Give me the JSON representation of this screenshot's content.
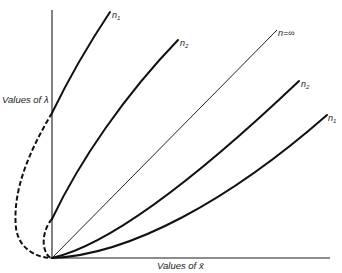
{
  "diagram": {
    "y_axis_label": "Values of λ",
    "x_axis_label": "Values of x̄",
    "curves": [
      {
        "id": "upper-n1",
        "label": "n",
        "subscript": "1",
        "style": "solid-thick",
        "dashed_continuation": true
      },
      {
        "id": "upper-n2",
        "label": "n",
        "subscript": "2",
        "style": "solid-thick",
        "dashed_continuation": true
      },
      {
        "id": "n-infinity",
        "label": "n=∞",
        "style": "solid-thin"
      },
      {
        "id": "lower-n2",
        "label": "n",
        "subscript": "2",
        "style": "solid-thick"
      },
      {
        "id": "lower-n1",
        "label": "n",
        "subscript": "1",
        "style": "solid-thick"
      }
    ],
    "labels": {
      "upper_n1": "n",
      "upper_n1_sub": "1",
      "upper_n2": "n",
      "upper_n2_sub": "2",
      "n_inf": "n=∞",
      "lower_n2": "n",
      "lower_n2_sub": "2",
      "lower_n1": "n",
      "lower_n1_sub": "1"
    }
  }
}
